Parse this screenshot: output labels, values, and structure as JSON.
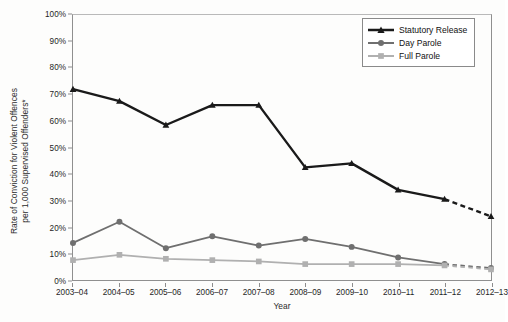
{
  "chart_data": {
    "type": "line",
    "title": "",
    "xlabel": "Year",
    "ylabel": "Rate of Conviction for Violent Offences per 1,000 Supervised Offenders*",
    "ylabel_line1": "Rate of Conviction for Violent Offences",
    "ylabel_line2": "per 1,000 Supervised Offenders*",
    "categories": [
      "2003–04",
      "2004–05",
      "2005–06",
      "2006–07",
      "2007–08",
      "2008–09",
      "2009–10",
      "2010–11",
      "2011–12",
      "2012–13"
    ],
    "ylim": [
      0,
      100
    ],
    "ytick_values": [
      0,
      10,
      20,
      30,
      40,
      50,
      60,
      70,
      80,
      90,
      100
    ],
    "ytick_labels": [
      "0%",
      "10%",
      "20%",
      "30%",
      "40%",
      "50%",
      "60%",
      "70%",
      "80%",
      "90%",
      "100%"
    ],
    "grid": false,
    "legend_position": "top-right",
    "dashed_last_segment": true,
    "series": [
      {
        "name": "Statutory Release",
        "color": "#1a1a1a",
        "marker": "triangle",
        "values": [
          72,
          67.5,
          58.5,
          66,
          66,
          42.5,
          44,
          34,
          30.5,
          24
        ]
      },
      {
        "name": "Day Parole",
        "color": "#6f6f6f",
        "marker": "circle",
        "values": [
          14,
          22,
          12,
          16.5,
          13,
          15.5,
          12.5,
          8.5,
          6,
          4.5
        ]
      },
      {
        "name": "Full Parole",
        "color": "#b0b0b0",
        "marker": "square",
        "values": [
          7.5,
          9.5,
          8,
          7.5,
          7,
          6,
          6,
          6,
          5.5,
          4
        ]
      }
    ]
  },
  "legend": {
    "items": [
      {
        "label": "Statutory Release"
      },
      {
        "label": "Day Parole"
      },
      {
        "label": "Full Parole"
      }
    ]
  }
}
